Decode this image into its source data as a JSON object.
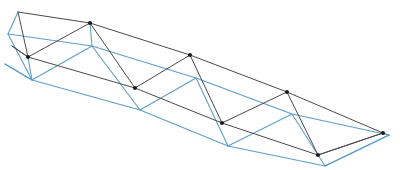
{
  "figure": {
    "background_color": "#ffffff",
    "width": 400,
    "height": 170
  },
  "style": {
    "dark_member_color": "#4a4a4a",
    "blue_member_color": "#5e9ec9",
    "joint_marker_color": "#1a1a1a",
    "dark_member_width": 1.0,
    "blue_member_width": 1.1,
    "joint_marker_radius": 2.0
  },
  "structures": [
    {
      "name": "front-truss",
      "color_key": "dark_member_color",
      "nodes": {
        "top_chord": [
          {
            "id": "T0",
            "x": 18,
            "y": 12
          },
          {
            "id": "T1",
            "x": 90,
            "y": 23
          },
          {
            "id": "T2",
            "x": 190,
            "y": 55
          },
          {
            "id": "T3",
            "x": 287,
            "y": 92
          },
          {
            "id": "T4",
            "x": 383,
            "y": 133
          }
        ],
        "bottom_chord": [
          {
            "id": "B0",
            "x": 12,
            "y": 46
          },
          {
            "id": "B1",
            "x": 28,
            "y": 57
          },
          {
            "id": "B2",
            "x": 135,
            "y": 88
          },
          {
            "id": "B3",
            "x": 222,
            "y": 123
          },
          {
            "id": "B4",
            "x": 318,
            "y": 155
          },
          {
            "id": "B5",
            "x": 383,
            "y": 133
          }
        ]
      },
      "chords": [
        {
          "name": "top-chord",
          "path": [
            [
              18,
              12
            ],
            [
              90,
              23
            ],
            [
              190,
              55
            ],
            [
              287,
              92
            ],
            [
              383,
              133
            ]
          ]
        },
        {
          "name": "bottom-chord",
          "path": [
            [
              12,
              46
            ],
            [
              28,
              57
            ],
            [
              135,
              88
            ],
            [
              222,
              123
            ],
            [
              318,
              155
            ],
            [
              383,
              133
            ]
          ]
        }
      ],
      "web_members": [
        {
          "name": "web-1",
          "from": [
            12,
            46
          ],
          "to": [
            28,
            57
          ]
        },
        {
          "name": "web-2",
          "from": [
            28,
            57
          ],
          "to": [
            90,
            23
          ]
        },
        {
          "name": "web-3",
          "from": [
            90,
            23
          ],
          "to": [
            135,
            88
          ]
        },
        {
          "name": "web-4",
          "from": [
            135,
            88
          ],
          "to": [
            190,
            55
          ]
        },
        {
          "name": "web-5",
          "from": [
            190,
            55
          ],
          "to": [
            222,
            123
          ]
        },
        {
          "name": "web-6",
          "from": [
            222,
            123
          ],
          "to": [
            287,
            92
          ]
        },
        {
          "name": "web-7",
          "from": [
            287,
            92
          ],
          "to": [
            318,
            155
          ]
        },
        {
          "name": "web-8",
          "from": [
            318,
            155
          ],
          "to": [
            383,
            133
          ]
        },
        {
          "name": "web-end-stub",
          "from": [
            18,
            12
          ],
          "to": [
            28,
            57
          ]
        }
      ],
      "joint_markers": [
        [
          90,
          23
        ],
        [
          190,
          55
        ],
        [
          287,
          92
        ],
        [
          383,
          133
        ],
        [
          28,
          57
        ],
        [
          135,
          88
        ],
        [
          222,
          123
        ],
        [
          318,
          155
        ]
      ]
    },
    {
      "name": "rear-truss",
      "color_key": "blue_member_color",
      "nodes": {
        "top_chord": [
          {
            "id": "t0",
            "x": 8,
            "y": 34
          },
          {
            "id": "t1",
            "x": 92,
            "y": 46
          },
          {
            "id": "t2",
            "x": 196,
            "y": 78
          },
          {
            "id": "t3",
            "x": 292,
            "y": 114
          },
          {
            "id": "t4",
            "x": 389,
            "y": 135
          }
        ],
        "bottom_chord": [
          {
            "id": "b0",
            "x": 5,
            "y": 64
          },
          {
            "id": "b1",
            "x": 32,
            "y": 80
          },
          {
            "id": "b2",
            "x": 140,
            "y": 110
          },
          {
            "id": "b3",
            "x": 228,
            "y": 146
          },
          {
            "id": "b4",
            "x": 325,
            "y": 166
          },
          {
            "id": "b5",
            "x": 389,
            "y": 135
          }
        ]
      },
      "chords": [
        {
          "name": "top-chord",
          "path": [
            [
              8,
              34
            ],
            [
              92,
              46
            ],
            [
              196,
              78
            ],
            [
              292,
              114
            ],
            [
              389,
              135
            ]
          ]
        },
        {
          "name": "bottom-chord",
          "path": [
            [
              5,
              64
            ],
            [
              32,
              80
            ],
            [
              140,
              110
            ],
            [
              228,
              146
            ],
            [
              325,
              166
            ],
            [
              389,
              135
            ]
          ]
        }
      ],
      "web_members": [
        {
          "name": "web-1",
          "from": [
            5,
            64
          ],
          "to": [
            32,
            80
          ]
        },
        {
          "name": "web-2",
          "from": [
            32,
            80
          ],
          "to": [
            92,
            46
          ]
        },
        {
          "name": "web-3",
          "from": [
            92,
            46
          ],
          "to": [
            140,
            110
          ]
        },
        {
          "name": "web-4",
          "from": [
            140,
            110
          ],
          "to": [
            196,
            78
          ]
        },
        {
          "name": "web-5",
          "from": [
            196,
            78
          ],
          "to": [
            228,
            146
          ]
        },
        {
          "name": "web-6",
          "from": [
            228,
            146
          ],
          "to": [
            292,
            114
          ]
        },
        {
          "name": "web-7",
          "from": [
            292,
            114
          ],
          "to": [
            325,
            166
          ]
        },
        {
          "name": "web-8",
          "from": [
            325,
            166
          ],
          "to": [
            389,
            135
          ]
        },
        {
          "name": "web-end-stub",
          "from": [
            8,
            34
          ],
          "to": [
            32,
            80
          ]
        }
      ],
      "joint_markers": []
    }
  ],
  "connectors": [
    {
      "name": "transverse-top-left",
      "from": [
        18,
        12
      ],
      "to": [
        8,
        34
      ],
      "color_key": "blue_member_color"
    },
    {
      "name": "transverse-top-apex-1",
      "from": [
        90,
        23
      ],
      "to": [
        92,
        46
      ],
      "color_key": "blue_member_color"
    },
    {
      "name": "transverse-bottom-left",
      "from": [
        28,
        57
      ],
      "to": [
        32,
        80
      ],
      "color_key": "blue_member_color"
    },
    {
      "name": "transverse-right-apex",
      "from": [
        383,
        133
      ],
      "to": [
        389,
        135
      ],
      "color_key": "blue_member_color"
    }
  ]
}
